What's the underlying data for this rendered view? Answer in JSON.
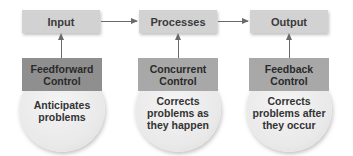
{
  "diagram": {
    "flow": [
      {
        "id": "input",
        "label": "Input"
      },
      {
        "id": "processes",
        "label": "Processes"
      },
      {
        "id": "output",
        "label": "Output"
      }
    ],
    "controls": [
      {
        "title_line1": "Feedforward",
        "title_line2": "Control",
        "desc_line1": "Anticipates",
        "desc_line2": "problems",
        "desc_line3": "",
        "targets": "input",
        "header_color": "#8f8f8f"
      },
      {
        "title_line1": "Concurrent",
        "title_line2": "Control",
        "desc_line1": "Corrects",
        "desc_line2": "problems as",
        "desc_line3": "they happen",
        "targets": "processes",
        "header_color": "#a8a8a8"
      },
      {
        "title_line1": "Feedback",
        "title_line2": "Control",
        "desc_line1": "Corrects",
        "desc_line2": "problems after",
        "desc_line3": "they occur",
        "targets": "output",
        "header_color": "#a8a8a8"
      }
    ],
    "colors": {
      "top_box": "#d2d2d2",
      "arrow": "#6a6a6a",
      "circle": "#ececec"
    }
  }
}
